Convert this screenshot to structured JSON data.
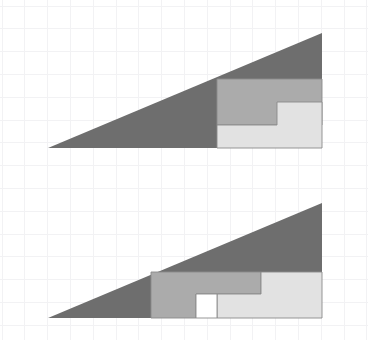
{
  "figure": {
    "canvas": {
      "width": 368,
      "height": 340,
      "background": "#ffffff"
    },
    "grid": {
      "visible": true,
      "color": "#f2f2f4",
      "spacing": 22.8,
      "origin_x": 2,
      "origin_y": 6,
      "columns": 16,
      "rows": 15
    },
    "colors": {
      "dark_gray": "#6e6e6e",
      "medium_gray": "#ababab",
      "light_gray": "#e2e2e2",
      "outline": "#8a8a8a",
      "hole": "#ffffff"
    },
    "panels": [
      {
        "name": "top-arrangement",
        "label": "Arrangement A (no hole)",
        "has_hole": false,
        "triangle": {
          "apex_x": 322,
          "apex_y": 33,
          "base_left_x": 48,
          "base_y": 148,
          "base_right_x": 322
        },
        "pieces": [
          {
            "name": "large-triangle",
            "fill_key": "dark_gray",
            "outline": false,
            "points": "48,148 322,33 322,148"
          },
          {
            "name": "medium-rectangle",
            "fill_key": "medium_gray",
            "outline": true,
            "points": "217,79 322,79 322,125 277,125 277,125 217,125"
          },
          {
            "name": "light-step-piece",
            "fill_key": "light_gray",
            "outline": true,
            "points": "217,125 277,125 277,102 322,102 322,148 217,148"
          }
        ]
      },
      {
        "name": "bottom-arrangement",
        "label": "Arrangement B (one square hole)",
        "has_hole": true,
        "triangle": {
          "apex_x": 322,
          "apex_y": 203,
          "base_left_x": 48,
          "base_y": 318,
          "base_right_x": 322
        },
        "hole": {
          "x": 196,
          "y": 294,
          "width": 21,
          "height": 24
        },
        "pieces": [
          {
            "name": "large-triangle",
            "fill_key": "dark_gray",
            "outline": false,
            "points": "48,318 322,203 322,318"
          },
          {
            "name": "medium-step-piece",
            "fill_key": "medium_gray",
            "outline": true,
            "points": "151,272 261,272 261,294 196,294 196,318 151,318"
          },
          {
            "name": "light-step-piece",
            "fill_key": "light_gray",
            "outline": true,
            "points": "261,272 322,272 322,318 217,318 217,294 261,294"
          },
          {
            "name": "square-hole",
            "fill_key": "hole",
            "outline": true,
            "points": "196,294 217,294 217,318 196,318"
          }
        ]
      }
    ]
  }
}
